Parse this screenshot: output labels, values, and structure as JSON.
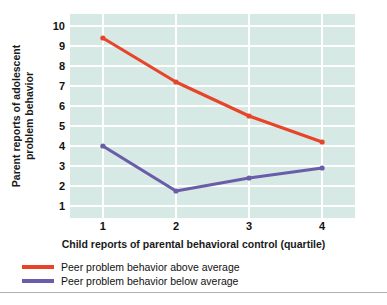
{
  "chart_data": {
    "type": "line",
    "title": "",
    "subtitle": "",
    "xlabel": "Child reports of parental behavioral control (quartile)",
    "ylabel": "Parent reports of adolescent problem behavior",
    "ylabel_lines": [
      "Parent reports of adolescent",
      "problem behavior"
    ],
    "categories": [
      "1",
      "2",
      "3",
      "4"
    ],
    "x": [
      1,
      2,
      3,
      4
    ],
    "xlim": [
      0.55,
      4.45
    ],
    "ylim": [
      0.4,
      10.6
    ],
    "yticks": [
      10,
      9,
      8,
      7,
      6,
      5,
      4,
      3,
      2,
      1
    ],
    "ytick_labels": [
      "10",
      "9",
      "8",
      "7",
      "6",
      "5",
      "4",
      "3",
      "2",
      "1"
    ],
    "xticks": [
      1,
      2,
      3,
      4
    ],
    "xtick_labels": [
      "1",
      "2",
      "3",
      "4"
    ],
    "grid": true,
    "grid_axis": "both",
    "grid_color": "#ffffff",
    "plot_background": "#d6e9e5",
    "figure_background": "#ffffff",
    "legend_position": "below-axes-left",
    "markers": true,
    "series": [
      {
        "name": "Peer problem behavior above average",
        "color": "#e8442a",
        "values": [
          9.4,
          7.2,
          5.5,
          4.2
        ]
      },
      {
        "name": "Peer problem behavior below average",
        "color": "#6a5ca8",
        "values": [
          4.0,
          1.75,
          2.4,
          2.9
        ]
      }
    ]
  },
  "legend": {
    "items": [
      {
        "label": "Peer problem behavior above average",
        "color": "#e8442a"
      },
      {
        "label": "Peer problem behavior below average",
        "color": "#6a5ca8"
      }
    ]
  }
}
